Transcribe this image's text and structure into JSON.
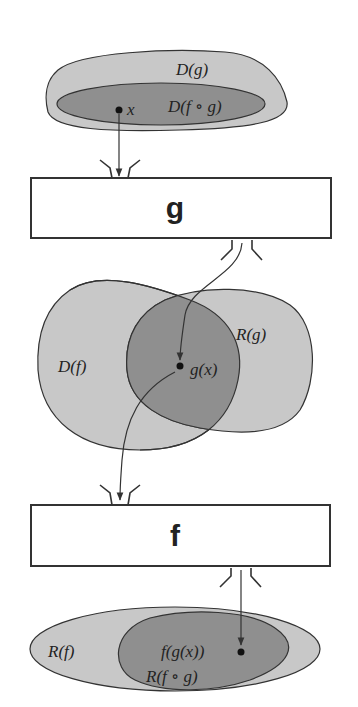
{
  "diagram": {
    "colors": {
      "light_region": "#c8c8c8",
      "dark_region": "#8f8f8f",
      "stroke": "#333333",
      "box_fill": "#ffffff"
    },
    "top_sets": {
      "outer_label": "D(g)",
      "inner_label": "D(f ∘ g)",
      "point_label": "x"
    },
    "box_g": {
      "label": "g"
    },
    "middle_sets": {
      "left_label": "D(f)",
      "right_label": "R(g)",
      "point_label": "g(x)"
    },
    "box_f": {
      "label": "f"
    },
    "bottom_sets": {
      "outer_label": "R(f)",
      "inner_label": "R(f ∘ g)",
      "point_label": "f(g(x))"
    }
  }
}
